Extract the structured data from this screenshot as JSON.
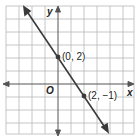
{
  "diagram": {
    "type": "coordinate-plane-line",
    "axes": {
      "x_label": "x",
      "y_label": "y",
      "origin_label": "O"
    },
    "grid": {
      "x_range": [
        -4,
        5
      ],
      "y_range": [
        -4,
        5
      ],
      "spacing_units": 1
    },
    "line": {
      "equation": "y = -1.5x + 2",
      "points": [
        {
          "label": "(0, 2)",
          "x": 0,
          "y": 2
        },
        {
          "label": "(2, −1)",
          "x": 2,
          "y": -1
        }
      ]
    },
    "colors": {
      "grid": "#b0b0b0",
      "axis": "#555555",
      "line": "#3a3a3a",
      "text": "#222222"
    }
  }
}
